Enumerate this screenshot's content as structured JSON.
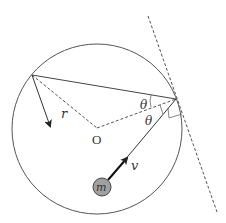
{
  "diagram": {
    "labels": {
      "radius": "r",
      "center": "O",
      "angle_top": "θ",
      "angle_bottom": "θ",
      "velocity": "v",
      "mass": "m"
    },
    "colors": {
      "stroke": "#444444",
      "mass_fill": "#a0a0a0",
      "background": "#ffffff"
    },
    "geometry": {
      "circle": {
        "cx": 97,
        "cy": 129,
        "r": 85
      },
      "center_point": {
        "x": 97,
        "y": 128
      },
      "point_A": {
        "x": 32,
        "y": 75
      },
      "point_P": {
        "x": 176,
        "y": 99
      },
      "tangent_line": {
        "x1": 148,
        "y1": 16,
        "x2": 217,
        "y2": 212
      },
      "mass": {
        "cx": 102,
        "cy": 187,
        "r": 9
      }
    }
  }
}
